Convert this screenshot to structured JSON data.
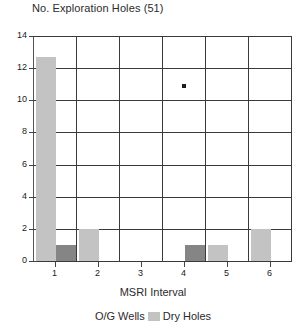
{
  "chart_data": {
    "type": "bar",
    "title": "No. Exploration Holes (51)",
    "xlabel": "MSRI Interval",
    "ylabel": "",
    "categories": [
      "1",
      "2",
      "3",
      "4",
      "5",
      "6"
    ],
    "xtick_labels": [
      "1",
      "2",
      "3",
      "4",
      "5",
      "6"
    ],
    "ytick_labels": [
      "0",
      "2",
      "4",
      "6",
      "8",
      "10",
      "12",
      "14"
    ],
    "ytick_values": [
      0,
      2,
      4,
      6,
      8,
      10,
      12,
      14
    ],
    "ylim": [
      0,
      14
    ],
    "grid": true,
    "legend_position": "bottom",
    "series": [
      {
        "name": "O/G Wells",
        "color": "#858585",
        "values": [
          1,
          0,
          0,
          1,
          0,
          0
        ]
      },
      {
        "name": "Dry Holes",
        "color": "#c3c3c3",
        "values": [
          12.7,
          2,
          0,
          0,
          1,
          2
        ]
      }
    ],
    "annotations": [
      {
        "name": "data-point-marker",
        "x": 3.5,
        "y": 10.9,
        "color": "#1c1c1c"
      }
    ]
  },
  "legend": {
    "items": [
      {
        "label": "O/G Wells",
        "color": "#858585"
      },
      {
        "label": "Dry Holes",
        "color": "#c3c3c3"
      }
    ]
  }
}
